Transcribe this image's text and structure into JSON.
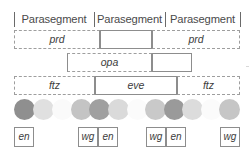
{
  "figure": {
    "background_color": "#ffffff",
    "line_color": "#8d8d8d",
    "text_color": "#3c3c3c"
  },
  "header": {
    "separator_positions_px": [
      14,
      94,
      165,
      240
    ],
    "segments": [
      {
        "label": "Parasegment",
        "x": 14,
        "width": 80
      },
      {
        "label": "Parasegment",
        "x": 94,
        "width": 71
      },
      {
        "label": "Parasegment",
        "x": 165,
        "width": 75
      }
    ]
  },
  "rows": [
    {
      "name": "prd",
      "top": 30,
      "boxes": [
        {
          "label": "prd",
          "x": 14,
          "width": 86,
          "dashed": [
            "left",
            "top",
            "bottom"
          ]
        },
        {
          "label": "",
          "x": 100,
          "width": 52,
          "dashed": []
        },
        {
          "label": "prd",
          "x": 152,
          "width": 88,
          "dashed": [
            "right",
            "top",
            "bottom"
          ]
        }
      ]
    },
    {
      "name": "opa",
      "top": 53,
      "boxes": [
        {
          "label": "opa",
          "x": 67,
          "width": 85,
          "dashed": [
            "top",
            "bottom"
          ]
        },
        {
          "label": "",
          "x": 152,
          "width": 40,
          "dashed": []
        }
      ]
    },
    {
      "name": "ftz-eve",
      "top": 76,
      "boxes": [
        {
          "label": "ftz",
          "x": 14,
          "width": 81,
          "dashed": [
            "left",
            "top",
            "bottom"
          ]
        },
        {
          "label": "eve",
          "x": 95,
          "width": 82,
          "dashed": []
        },
        {
          "label": "ftz",
          "x": 177,
          "width": 63,
          "dashed": [
            "right",
            "top",
            "bottom"
          ]
        }
      ]
    }
  ],
  "circles": {
    "diameter": 21,
    "items": [
      {
        "x": 14,
        "color": "#8f8f8f"
      },
      {
        "x": 33,
        "color": "#e0e0e0"
      },
      {
        "x": 52,
        "color": "#fafafa"
      },
      {
        "x": 71,
        "color": "#c4c4c4"
      },
      {
        "x": 89,
        "color": "#a0a0a0"
      },
      {
        "x": 108,
        "color": "#dadada"
      },
      {
        "x": 127,
        "color": "#fbfbfb"
      },
      {
        "x": 145,
        "color": "#c9c9c9"
      },
      {
        "x": 164,
        "color": "#9a9a9a"
      },
      {
        "x": 182,
        "color": "#dcdcdc"
      },
      {
        "x": 201,
        "color": "#fbfbfb"
      },
      {
        "x": 219,
        "color": "#c6c6c6"
      }
    ]
  },
  "tags": [
    {
      "label": "en",
      "x": 14
    },
    {
      "label": "wg",
      "x": 78
    },
    {
      "label": "en",
      "x": 98
    },
    {
      "label": "wg",
      "x": 146
    },
    {
      "label": "en",
      "x": 166
    },
    {
      "label": "wg",
      "x": 220
    }
  ]
}
